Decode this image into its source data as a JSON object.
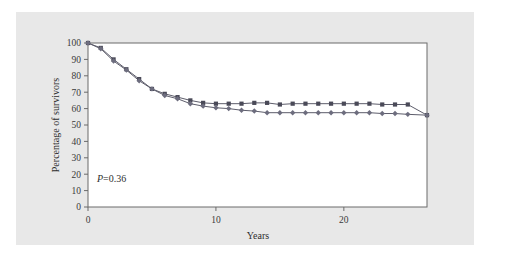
{
  "figure": {
    "panel_background": "#e8e8e8",
    "plot_background": "#ffffff",
    "frame_color": "#6b6b6b"
  },
  "annotations": {
    "pvalue_italic": "P",
    "pvalue_rest": "=0.36"
  },
  "chart_data": {
    "type": "line",
    "title": "",
    "subtitle": "",
    "xlabel": "Years",
    "ylabel": "Percentage of survivors",
    "xlim": [
      0,
      26.5
    ],
    "ylim": [
      0,
      100
    ],
    "xticks": [
      0,
      10,
      20
    ],
    "xticklabels": [
      "0",
      "10",
      "20"
    ],
    "yticks": [
      0,
      10,
      20,
      30,
      40,
      50,
      60,
      70,
      80,
      90,
      100
    ],
    "yticklabels": [
      "0",
      "10",
      "20",
      "30",
      "40",
      "50",
      "60",
      "70",
      "80",
      "90",
      "100"
    ],
    "grid": false,
    "legend": "none",
    "annotation_text": "P=0.36",
    "marker_upper": "square",
    "marker_lower": "diamond",
    "series": [
      {
        "name": "upper-survival-curve",
        "marker": "square",
        "color": "#4a4a58",
        "x": [
          0,
          1,
          2,
          3,
          4,
          5,
          6,
          7,
          8,
          9,
          10,
          11,
          12,
          13,
          14,
          15,
          16,
          17,
          18,
          19,
          20,
          21,
          22,
          23,
          24,
          25,
          26.5
        ],
        "values": [
          100,
          97,
          90,
          84,
          78,
          72,
          69,
          67,
          65,
          63.5,
          63,
          63,
          63,
          63.5,
          63.5,
          62.5,
          63,
          63,
          63,
          63,
          63,
          63,
          63,
          62.5,
          62.5,
          62.5,
          56
        ]
      },
      {
        "name": "lower-survival-curve",
        "marker": "diamond",
        "color": "#6d6d7e",
        "x": [
          0,
          1,
          2,
          3,
          4,
          5,
          6,
          7,
          8,
          9,
          10,
          11,
          12,
          13,
          14,
          15,
          16,
          17,
          18,
          19,
          20,
          21,
          22,
          23,
          24,
          25,
          26.5
        ],
        "values": [
          100,
          96.5,
          89,
          83.5,
          77,
          72,
          68,
          66,
          63,
          61.5,
          60.5,
          60,
          59,
          58.5,
          57.5,
          57.5,
          57.5,
          57.5,
          57.5,
          57.5,
          57.5,
          57.5,
          57.5,
          57,
          57,
          56.5,
          56
        ]
      }
    ]
  }
}
